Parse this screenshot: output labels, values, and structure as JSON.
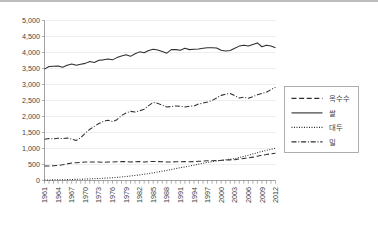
{
  "chart_data": {
    "type": "line",
    "title": "",
    "subtitle": "",
    "xlabel": "",
    "ylabel": "",
    "xlim": [
      1961,
      2012
    ],
    "ylim": [
      0,
      5000
    ],
    "ytick_labels": [
      "0",
      "500",
      "1,000",
      "1,500",
      "2,000",
      "2,500",
      "3,000",
      "3,500",
      "4,000",
      "4,500",
      "5,000"
    ],
    "ytick_values": [
      0,
      500,
      1000,
      1500,
      2000,
      2500,
      3000,
      3500,
      4000,
      4500,
      5000
    ],
    "xtick_labels": [
      "1961",
      "1964",
      "1967",
      "1970",
      "1973",
      "1976",
      "1979",
      "1982",
      "1985",
      "1988",
      "1991",
      "1994",
      "1997",
      "2000",
      "2003",
      "2006",
      "2009",
      "2012"
    ],
    "xtick_values": [
      1961,
      1964,
      1967,
      1970,
      1973,
      1976,
      1979,
      1982,
      1985,
      1988,
      1991,
      1994,
      1997,
      2000,
      2003,
      2006,
      2009,
      2012
    ],
    "grid": true,
    "grid_axis": "y",
    "legend_position": "right",
    "x": [
      1961,
      1962,
      1963,
      1964,
      1965,
      1966,
      1967,
      1968,
      1969,
      1970,
      1971,
      1972,
      1973,
      1974,
      1975,
      1976,
      1977,
      1978,
      1979,
      1980,
      1981,
      1982,
      1983,
      1984,
      1985,
      1986,
      1987,
      1988,
      1989,
      1990,
      1991,
      1992,
      1993,
      1994,
      1995,
      1996,
      1997,
      1998,
      1999,
      2000,
      2001,
      2002,
      2003,
      2004,
      2005,
      2006,
      2007,
      2008,
      2009,
      2010,
      2011,
      2012
    ],
    "series": [
      {
        "name": "옥수수",
        "style": "dashed",
        "values": [
          455,
          450,
          460,
          470,
          490,
          520,
          545,
          555,
          565,
          575,
          580,
          575,
          580,
          570,
          575,
          580,
          585,
          590,
          590,
          580,
          585,
          590,
          575,
          590,
          595,
          590,
          585,
          575,
          580,
          585,
          585,
          590,
          585,
          590,
          600,
          605,
          615,
          620,
          625,
          630,
          640,
          645,
          650,
          670,
          690,
          710,
          730,
          760,
          790,
          810,
          835,
          850
        ]
      },
      {
        "name": "쌀",
        "style": "solid",
        "values": [
          3480,
          3560,
          3570,
          3580,
          3540,
          3600,
          3640,
          3600,
          3630,
          3660,
          3720,
          3690,
          3760,
          3770,
          3800,
          3770,
          3840,
          3890,
          3930,
          3880,
          3960,
          4020,
          3990,
          4060,
          4100,
          4080,
          4030,
          3980,
          4090,
          4090,
          4070,
          4130,
          4090,
          4100,
          4110,
          4130,
          4150,
          4150,
          4140,
          4070,
          4050,
          4060,
          4130,
          4200,
          4230,
          4200,
          4250,
          4300,
          4180,
          4230,
          4200,
          4150
        ]
      },
      {
        "name": "대두",
        "style": "dotted",
        "values": [
          15,
          18,
          20,
          22,
          25,
          28,
          32,
          36,
          40,
          45,
          50,
          55,
          62,
          70,
          78,
          86,
          98,
          110,
          125,
          140,
          158,
          175,
          195,
          215,
          240,
          265,
          290,
          315,
          345,
          370,
          400,
          425,
          450,
          480,
          510,
          540,
          565,
          590,
          610,
          630,
          650,
          665,
          685,
          720,
          755,
          790,
          830,
          870,
          910,
          940,
          975,
          1010
        ]
      },
      {
        "name": "밀",
        "style": "dashdot",
        "values": [
          1290,
          1310,
          1300,
          1320,
          1310,
          1330,
          1290,
          1250,
          1340,
          1480,
          1600,
          1690,
          1780,
          1850,
          1880,
          1840,
          1900,
          2030,
          2110,
          2160,
          2140,
          2180,
          2230,
          2340,
          2440,
          2410,
          2350,
          2300,
          2310,
          2330,
          2320,
          2300,
          2320,
          2330,
          2390,
          2420,
          2450,
          2500,
          2580,
          2660,
          2700,
          2720,
          2650,
          2580,
          2600,
          2570,
          2620,
          2680,
          2720,
          2760,
          2840,
          2910
        ]
      }
    ]
  },
  "legend": {
    "items": [
      {
        "label": "옥수수",
        "style": "dashed"
      },
      {
        "label": "쌀",
        "style": "solid"
      },
      {
        "label": "대두",
        "style": "dotted"
      },
      {
        "label": "밀",
        "style": "dashdot"
      }
    ]
  }
}
